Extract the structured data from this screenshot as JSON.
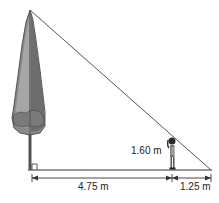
{
  "diagram": {
    "type": "similar-triangles-shadow-problem",
    "objects": {
      "tree": {
        "icon": "tree-icon"
      },
      "person": {
        "icon": "person-icon"
      }
    },
    "labels": {
      "person_height": "1.60 m",
      "distance_tree_to_person": "4.75 m",
      "distance_person_to_shadow_tip": "1.25 m"
    },
    "markers": {
      "right_angle": "right-angle-at-tree-base"
    },
    "colors": {
      "line": "#333333",
      "tree_dark": "#6e6e6e",
      "tree_light": "#a4a4a4",
      "person": "#444444"
    }
  }
}
